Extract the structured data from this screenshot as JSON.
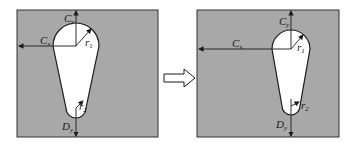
{
  "diagram": {
    "type": "shape-transformation",
    "colors": {
      "plate": "#a8a8a8",
      "hole": "#ffffff",
      "stroke": "#1a1a1a",
      "arrow_fill": "#ffffff"
    },
    "left_panel": {
      "labels": {
        "cy": {
          "main": "C",
          "sub": "y"
        },
        "cx": {
          "main": "C",
          "sub": "x"
        },
        "r1": {
          "main": "r",
          "sub": "1"
        },
        "r2": {
          "main": "r",
          "sub": "2"
        },
        "dy": {
          "main": "D",
          "sub": "y"
        }
      }
    },
    "arrow": {
      "direction": "right",
      "style": "hollow-block"
    },
    "right_panel": {
      "labels": {
        "cy": {
          "main": "C",
          "sub": "y"
        },
        "cx": {
          "main": "C",
          "sub": "x"
        },
        "r1": {
          "main": "r",
          "sub": "1"
        },
        "r2": {
          "main": "r",
          "sub": "2"
        },
        "dy": {
          "main": "D",
          "sub": "y"
        }
      }
    }
  }
}
